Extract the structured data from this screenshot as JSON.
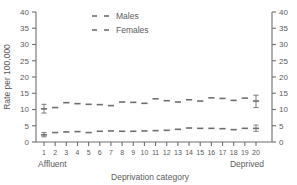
{
  "chart_data": {
    "type": "scatter",
    "title": "",
    "xlabel": "Deprivation category",
    "ylabel": "Rate per 100,000",
    "ylim": [
      0,
      40
    ],
    "yticks": [
      0,
      5,
      10,
      15,
      20,
      25,
      30,
      35,
      40
    ],
    "right_axis": true,
    "right_yticks": [
      0,
      5,
      10,
      15,
      20,
      25,
      30,
      35,
      40
    ],
    "grid": false,
    "legend_position": "top-center",
    "categories": [
      1,
      2,
      3,
      4,
      5,
      6,
      7,
      8,
      9,
      10,
      11,
      12,
      13,
      14,
      15,
      16,
      17,
      18,
      19,
      20
    ],
    "xtick_labels": [
      "1",
      "2",
      "3",
      "4",
      "5",
      "6",
      "7",
      "8",
      "9",
      "10",
      "11",
      "12",
      "13",
      "14",
      "15",
      "16",
      "17",
      "18",
      "19",
      "20"
    ],
    "x_end_labels": {
      "left": "Affluent",
      "right": "Deprived"
    },
    "series": [
      {
        "name": "Males",
        "marker": "dash",
        "color": "#6e6e6e",
        "values": [
          10.2,
          10.6,
          12.1,
          11.8,
          11.6,
          11.5,
          11.2,
          12.3,
          12.2,
          11.9,
          13.3,
          12.7,
          12.3,
          13.0,
          12.6,
          13.6,
          13.4,
          12.8,
          13.5,
          12.6
        ],
        "error_bars": [
          {
            "category": 1,
            "value": 10.2,
            "low": 8.9,
            "high": 11.6
          },
          {
            "category": 20,
            "value": 12.6,
            "low": 10.6,
            "high": 14.4
          }
        ]
      },
      {
        "name": "Females",
        "marker": "dash",
        "color": "#6e6e6e",
        "values": [
          2.2,
          2.9,
          3.1,
          3.2,
          2.9,
          3.3,
          3.4,
          3.3,
          3.3,
          3.4,
          3.5,
          3.6,
          3.9,
          4.3,
          4.2,
          4.2,
          4.1,
          3.8,
          4.2,
          4.2
        ],
        "error_bars": [
          {
            "category": 1,
            "value": 2.2,
            "low": 1.6,
            "high": 2.9
          },
          {
            "category": 20,
            "value": 4.2,
            "low": 3.3,
            "high": 5.2
          }
        ]
      }
    ]
  },
  "legend": {
    "entries": [
      {
        "label": "Males"
      },
      {
        "label": "Females"
      }
    ]
  },
  "axes": {
    "y_left_title": "Rate per 100,000",
    "x_title": "Deprivation category",
    "affluent_label": "Affluent",
    "deprived_label": "Deprived"
  },
  "colors": {
    "ink": "#5b5b5b",
    "axis": "#6e6e6e",
    "marker": "#6e6e6e",
    "background": "#ffffff"
  }
}
